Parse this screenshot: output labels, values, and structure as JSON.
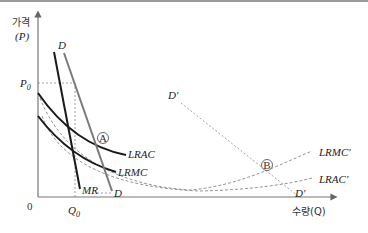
{
  "diagram": {
    "y_axis": {
      "label_line1": "가격",
      "label_line2": "(P)"
    },
    "x_axis": {
      "label": "수량(Q)",
      "origin": "0"
    },
    "ticks": {
      "p0": "P",
      "p0_sub": "0",
      "q0": "Q",
      "q0_sub": "0"
    },
    "curves": {
      "demand": "D",
      "demand_end": "D",
      "marginal_revenue": "MR",
      "lrac": "LRAC",
      "lrmc": "LRMC",
      "demand_prime": "D′",
      "demand_prime_end": "D′",
      "lrmc_prime": "LRMC′",
      "lrac_prime": "LRAC′"
    },
    "points": {
      "a": "A",
      "b": "B"
    },
    "colors": {
      "solid": "#1a1a1a",
      "demand": "#7a7a7a",
      "dashed": "#8a8a8a",
      "axis": "#777777"
    }
  }
}
